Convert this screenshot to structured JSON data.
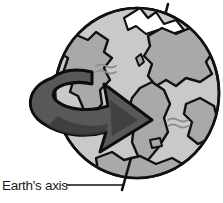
{
  "diagram": {
    "background_color": "#ffffff",
    "annotation": {
      "label": "Earth's axis",
      "label_color": "#1a1a1a",
      "leader_line_color": "#111111"
    },
    "globe": {
      "name": "earth-globe",
      "ocean_color": "#c9c9c9",
      "land_color": "#a9a9a9",
      "outline_color": "#111111",
      "highlight_color": "#ffffff",
      "center_x": 137,
      "center_y": 93,
      "radius_x": 82,
      "radius_y": 85,
      "tilt_degrees": 23
    },
    "axis": {
      "name": "rotation-axis-rod",
      "color": "#111111",
      "top_point": [
        168,
        4
      ],
      "bottom_point": [
        122,
        186
      ],
      "tilt_degrees": 23
    },
    "rotation_arrow": {
      "name": "rotation-direction-arrow",
      "fill_color": "#585858",
      "shadow_color": "#3c3c3c",
      "outline_color": "#0d0d0d",
      "direction": "west-to-east",
      "points_toward": "right-down"
    },
    "ocean_wave_marks": [
      {
        "x": 104,
        "y": 68
      },
      {
        "x": 104,
        "y": 74
      },
      {
        "x": 176,
        "y": 122
      },
      {
        "x": 176,
        "y": 128
      }
    ]
  }
}
